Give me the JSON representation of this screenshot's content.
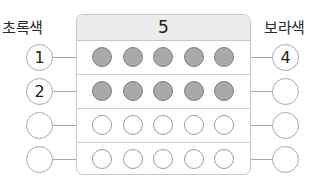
{
  "labels": {
    "left": "초록색",
    "right": "보라색"
  },
  "header": {
    "total": "5"
  },
  "rows": [
    {
      "left": "1",
      "right": "4",
      "filled": 5
    },
    {
      "left": "2",
      "right": "",
      "filled": 5
    },
    {
      "left": "",
      "right": "",
      "filled": 0
    },
    {
      "left": "",
      "right": "",
      "filled": 0
    }
  ],
  "colors": {
    "filled_dot": "#a9a9a9",
    "header_bg": "#ececec",
    "border": "#c8c8c8"
  }
}
